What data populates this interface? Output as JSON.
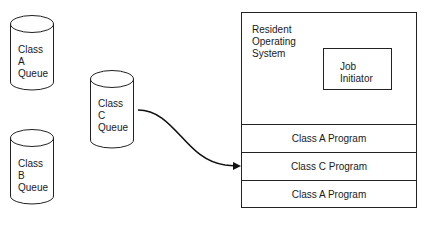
{
  "queues": [
    {
      "id": "class-a-queue",
      "lines": [
        "Class",
        "A",
        "Queue"
      ]
    },
    {
      "id": "class-b-queue",
      "lines": [
        "Class",
        "B",
        "Queue"
      ]
    },
    {
      "id": "class-c-queue",
      "lines": [
        "Class",
        "C",
        "Queue"
      ]
    }
  ],
  "memory": {
    "os_title": [
      "Resident",
      "Operating",
      "System"
    ],
    "job_initiator": [
      "Job",
      "Initiator"
    ],
    "partitions": [
      "Class A Program",
      "Class C Program",
      "Class A Program"
    ]
  }
}
